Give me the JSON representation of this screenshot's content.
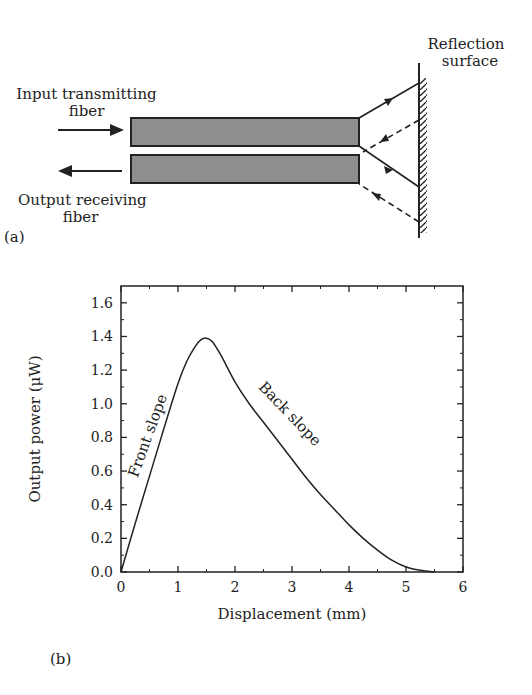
{
  "diagram": {
    "panel_label": "(a)",
    "input_label_line1": "Input transmitting",
    "input_label_line2": "fiber",
    "output_label_line1": "Output receiving",
    "output_label_line2": "fiber",
    "surface_label_line1": "Reflection",
    "surface_label_line2": "surface",
    "fiber_fill_color": "#8e8e8e",
    "line_color": "#222222"
  },
  "chart": {
    "panel_label": "(b)"
  },
  "chart_data": {
    "type": "line",
    "title": "",
    "xlabel": "Displacement (mm)",
    "ylabel": "Output power (μW)",
    "xlim": [
      0,
      6
    ],
    "ylim": [
      0,
      1.7
    ],
    "xticks": [
      "0",
      "1",
      "2",
      "3",
      "4",
      "5",
      "6"
    ],
    "yticks": [
      "0.0",
      "0.2",
      "0.4",
      "0.6",
      "0.8",
      "1.0",
      "1.2",
      "1.4",
      "1.6"
    ],
    "grid": false,
    "legend": null,
    "series": [
      {
        "name": "Output power",
        "x": [
          0,
          0.25,
          0.5,
          0.75,
          1.0,
          1.15,
          1.3,
          1.4,
          1.5,
          1.6,
          1.75,
          2.0,
          2.25,
          2.5,
          2.75,
          3.0,
          3.25,
          3.5,
          3.75,
          4.0,
          4.25,
          4.5,
          4.75,
          5.0,
          5.25,
          5.5
        ],
        "values": [
          0,
          0.29,
          0.57,
          0.85,
          1.12,
          1.25,
          1.34,
          1.38,
          1.39,
          1.37,
          1.29,
          1.13,
          1.0,
          0.89,
          0.78,
          0.67,
          0.56,
          0.46,
          0.37,
          0.28,
          0.2,
          0.13,
          0.07,
          0.03,
          0.01,
          0.0
        ]
      }
    ],
    "annotations": [
      {
        "text": "Front slope",
        "x": 0.55,
        "y": 0.8,
        "rotation": -70
      },
      {
        "text": "Back slope",
        "x": 2.9,
        "y": 0.92,
        "rotation": 46
      }
    ]
  }
}
